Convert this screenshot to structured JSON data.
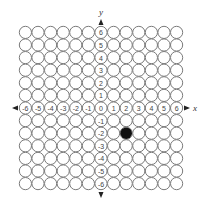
{
  "diagram": {
    "type": "coordinate-grid",
    "x_axis_label": "x",
    "y_axis_label": "y",
    "x_range": [
      -6,
      6
    ],
    "y_range": [
      -6,
      6
    ],
    "x_tick_labels": [
      "-6",
      "-5",
      "-4",
      "-3",
      "-2",
      "-1",
      "0",
      "1",
      "2",
      "3",
      "4",
      "5",
      "6"
    ],
    "y_tick_labels": [
      "6",
      "5",
      "4",
      "3",
      "2",
      "1",
      "-1",
      "-2",
      "-3",
      "-4",
      "-5",
      "-6"
    ],
    "marked_point": {
      "x": 2,
      "y": -2,
      "color": "#111111"
    },
    "grid_stroke_color": "#7a7a7a"
  }
}
